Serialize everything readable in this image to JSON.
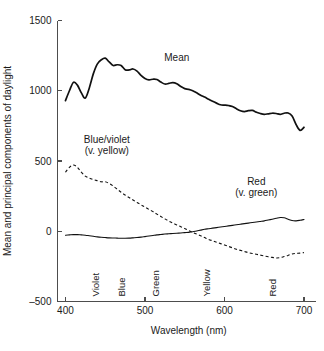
{
  "chart_data": {
    "type": "line",
    "title": "",
    "xlabel": "Wavelength (nm)",
    "ylabel": "Mean and principal components of daylight",
    "xlim": [
      390,
      705
    ],
    "ylim": [
      -500,
      1500
    ],
    "xticks": [
      400,
      500,
      600,
      700
    ],
    "xticklabels": [
      "400",
      "500",
      "600",
      "700"
    ],
    "yticks": [
      -500,
      0,
      500,
      1000,
      1500
    ],
    "yticklabels": [
      "-500",
      "0",
      "500",
      "1000",
      "1500"
    ],
    "grid": false,
    "legend_position": "inline-annotations",
    "annotations": [
      {
        "name": "mean",
        "lines": [
          "Mean"
        ],
        "x": 540,
        "y": 1215
      },
      {
        "name": "blue-violet",
        "lines": [
          "Blue/violet",
          "(v. yellow)"
        ],
        "x": 452,
        "y": 630
      },
      {
        "name": "red",
        "lines": [
          "Red",
          "(v. green)"
        ],
        "x": 640,
        "y": 330
      }
    ],
    "band_labels": [
      {
        "label": "Violet",
        "x": 438
      },
      {
        "label": "Blue",
        "x": 470
      },
      {
        "label": "Green",
        "x": 513
      },
      {
        "label": "Yellow",
        "x": 578
      },
      {
        "label": "Red",
        "x": 660
      }
    ],
    "x": [
      400,
      405,
      410,
      415,
      420,
      425,
      430,
      435,
      440,
      445,
      450,
      455,
      460,
      465,
      470,
      475,
      480,
      485,
      490,
      495,
      500,
      505,
      510,
      515,
      520,
      525,
      530,
      535,
      540,
      545,
      550,
      555,
      560,
      565,
      570,
      575,
      580,
      585,
      590,
      595,
      600,
      605,
      610,
      615,
      620,
      625,
      630,
      635,
      640,
      645,
      650,
      655,
      660,
      665,
      670,
      675,
      680,
      685,
      690,
      695,
      700
    ],
    "series": [
      {
        "name": "Mean",
        "style": "solid",
        "values": [
          930,
          1000,
          1060,
          1040,
          985,
          948,
          1020,
          1120,
          1190,
          1220,
          1232,
          1205,
          1180,
          1185,
          1180,
          1150,
          1148,
          1155,
          1140,
          1110,
          1088,
          1078,
          1082,
          1080,
          1062,
          1048,
          1052,
          1058,
          1050,
          1030,
          1015,
          1010,
          1000,
          985,
          968,
          955,
          940,
          925,
          912,
          900,
          898,
          895,
          888,
          872,
          858,
          852,
          858,
          860,
          848,
          838,
          832,
          836,
          840,
          838,
          832,
          840,
          842,
          820,
          760,
          718,
          740
        ]
      },
      {
        "name": "Blue/violet (v. yellow)",
        "style": "dashed",
        "values": [
          420,
          455,
          472,
          455,
          420,
          392,
          378,
          368,
          360,
          352,
          352,
          340,
          322,
          300,
          278,
          258,
          240,
          222,
          205,
          188,
          172,
          155,
          140,
          122,
          105,
          88,
          72,
          58,
          45,
          32,
          20,
          5,
          -8,
          -20,
          -32,
          -45,
          -58,
          -68,
          -78,
          -88,
          -98,
          -108,
          -118,
          -128,
          -136,
          -144,
          -152,
          -158,
          -164,
          -170,
          -176,
          -182,
          -186,
          -190,
          -188,
          -180,
          -172,
          -162,
          -158,
          -156,
          -152
        ]
      },
      {
        "name": "Red (v. green)",
        "style": "thin",
        "values": [
          -28,
          -26,
          -24,
          -24,
          -26,
          -28,
          -32,
          -36,
          -40,
          -43,
          -45,
          -47,
          -48,
          -49,
          -50,
          -50,
          -49,
          -47,
          -45,
          -42,
          -38,
          -34,
          -30,
          -26,
          -23,
          -20,
          -18,
          -16,
          -14,
          -12,
          -10,
          -8,
          -4,
          2,
          8,
          14,
          18,
          22,
          26,
          30,
          34,
          38,
          42,
          46,
          50,
          54,
          58,
          62,
          66,
          70,
          74,
          80,
          86,
          92,
          98,
          96,
          86,
          76,
          74,
          78,
          84
        ]
      }
    ]
  }
}
